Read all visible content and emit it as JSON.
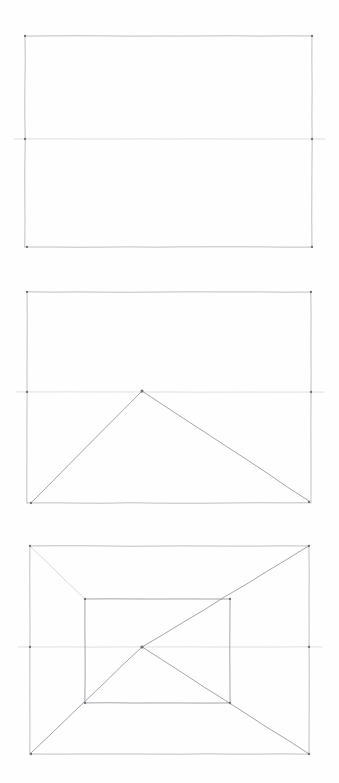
{
  "document": {
    "title": "One-point perspective construction sketch",
    "medium": "graphite pencil on paper",
    "background_color": "#fefefe",
    "canvas": {
      "width": 339,
      "height": 783
    }
  },
  "ink": {
    "line_color": "#b9b9bd",
    "line_color_dark": "#8e8e96",
    "line_color_faint": "#d2d2d6",
    "node_color": "#6f6f79",
    "stroke_width": 0.8,
    "stroke_width_frame": 0.9,
    "stroke_width_faint": 0.7
  },
  "panels": [
    {
      "id": "panel-1",
      "name": "stage-1-picture-plane",
      "label": "Rectangle with horizon line",
      "frame": {
        "x1": 25,
        "y1": 36,
        "x2": 312,
        "y2": 247
      },
      "horizon": {
        "y": 139,
        "x1": 14,
        "x2": 325
      },
      "elements": [
        "outer-rectangle",
        "horizon-line"
      ],
      "corner_nodes": [
        {
          "x": 25,
          "y": 36
        },
        {
          "x": 312,
          "y": 36
        },
        {
          "x": 312,
          "y": 247
        },
        {
          "x": 27,
          "y": 247
        }
      ],
      "horizon_nodes": [
        {
          "x": 25,
          "y": 139
        },
        {
          "x": 312,
          "y": 139
        }
      ]
    },
    {
      "id": "panel-2",
      "name": "stage-2-vanishing-point-rays",
      "label": "Rectangle with horizon line and two rays from bottom corners to vanishing point",
      "frame": {
        "x1": 27,
        "y1": 292,
        "x2": 311,
        "y2": 503
      },
      "horizon": {
        "y": 392,
        "x1": 16,
        "x2": 324
      },
      "vanishing_point": {
        "x": 142,
        "y": 391
      },
      "rays": [
        {
          "from": {
            "x": 31,
            "y": 503
          },
          "to": {
            "x": 142,
            "y": 391
          }
        },
        {
          "from": {
            "x": 309,
            "y": 501
          },
          "to": {
            "x": 142,
            "y": 391
          }
        }
      ],
      "elements": [
        "outer-rectangle",
        "horizon-line",
        "vanishing-point",
        "left-ray",
        "right-ray"
      ],
      "corner_nodes": [
        {
          "x": 27,
          "y": 292
        },
        {
          "x": 311,
          "y": 292
        },
        {
          "x": 309,
          "y": 502
        },
        {
          "x": 31,
          "y": 503
        }
      ],
      "horizon_nodes": [
        {
          "x": 27,
          "y": 392
        },
        {
          "x": 311,
          "y": 392
        }
      ]
    },
    {
      "id": "panel-3",
      "name": "stage-3-one-point-room",
      "label": "Outer rectangle, inner rectangle and four diagonals converging on the centre vanishing point",
      "frame": {
        "x1": 30,
        "y1": 546,
        "x2": 309,
        "y2": 754
      },
      "horizon": {
        "y": 647,
        "x1": 18,
        "x2": 322
      },
      "vanishing_point": {
        "x": 142,
        "y": 647
      },
      "inner_rectangle": {
        "x1": 85,
        "y1": 599,
        "x2": 230,
        "y2": 703
      },
      "diagonals": [
        {
          "from": {
            "x": 30,
            "y": 546
          },
          "to": {
            "x": 85,
            "y": 599
          },
          "note": "top-left outer to top-left inner, partial stroke"
        },
        {
          "from": {
            "x": 309,
            "y": 546
          },
          "to": {
            "x": 142,
            "y": 647
          },
          "note": "top-right outer through inner top-right to vanishing point"
        },
        {
          "from": {
            "x": 30,
            "y": 754
          },
          "to": {
            "x": 142,
            "y": 647
          },
          "note": "bottom-left outer through inner bottom-left to vanishing point"
        },
        {
          "from": {
            "x": 309,
            "y": 754
          },
          "to": {
            "x": 142,
            "y": 647
          },
          "note": "bottom-right outer through inner bottom-right to vanishing point"
        }
      ],
      "elements": [
        "outer-rectangle",
        "inner-rectangle",
        "horizon-line",
        "vanishing-point",
        "diagonal-top-left",
        "diagonal-top-right",
        "diagonal-bottom-left",
        "diagonal-bottom-right"
      ],
      "corner_nodes": [
        {
          "x": 30,
          "y": 546
        },
        {
          "x": 309,
          "y": 546
        },
        {
          "x": 309,
          "y": 754
        },
        {
          "x": 31,
          "y": 754
        }
      ],
      "inner_nodes": [
        {
          "x": 85,
          "y": 599
        },
        {
          "x": 230,
          "y": 599
        },
        {
          "x": 230,
          "y": 703
        },
        {
          "x": 85,
          "y": 703
        }
      ],
      "horizon_nodes": [
        {
          "x": 30,
          "y": 647
        },
        {
          "x": 309,
          "y": 647
        }
      ]
    }
  ]
}
